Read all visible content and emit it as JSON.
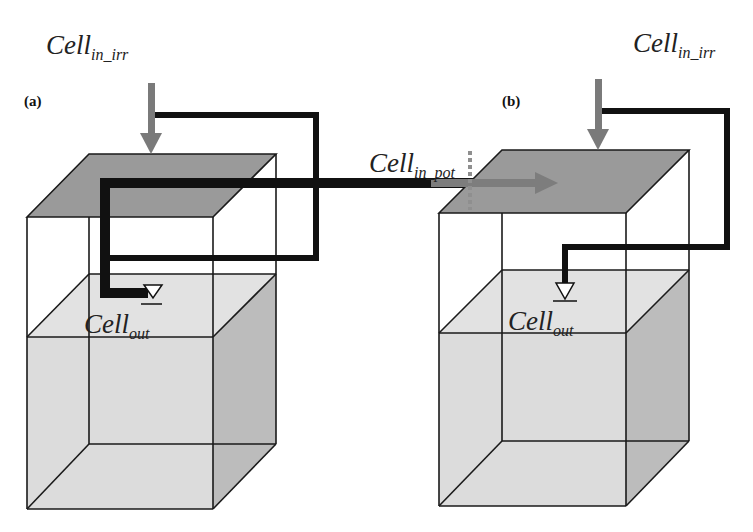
{
  "figure": {
    "panels": [
      {
        "id": "a",
        "label": "(a)",
        "inflow_irr": {
          "base": "Cell",
          "subscript": "in_irr"
        },
        "outflow": {
          "base": "Cell",
          "subscript": "out"
        }
      },
      {
        "id": "b",
        "label": "(b)",
        "inflow_irr": {
          "base": "Cell",
          "subscript": "in_irr"
        },
        "inflow_pot": {
          "base": "Cell",
          "subscript": "in_pot"
        },
        "outflow": {
          "base": "Cell",
          "subscript": "out"
        }
      }
    ],
    "colors": {
      "surface_layer": "#9a9a9a",
      "soil_block": "#dcdcdc",
      "soil_side": "#bdbdbd",
      "irr_arrow": "#7a7a7a",
      "flow_line": "#111111",
      "edge": "#1a1a1a",
      "background": "#ffffff"
    }
  }
}
